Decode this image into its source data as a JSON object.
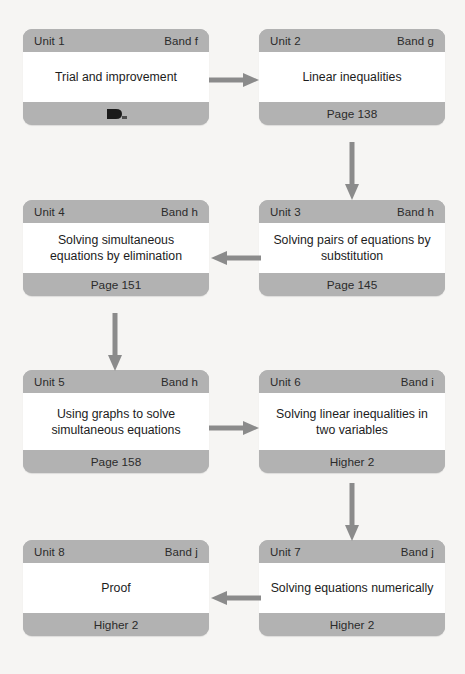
{
  "diagram": {
    "background_color": "#f6f5f3",
    "band_color": "#b2b2b2",
    "body_color": "#ffffff",
    "arrow_color": "#8b8b8b",
    "text_color": "#1c1c1c"
  },
  "units": [
    {
      "id": "unit-1",
      "unit": "Unit 1",
      "band": "Band f",
      "title": "Trial and improvement",
      "footer": "",
      "footer_icon": "smudge-icon",
      "footer_obscured": true
    },
    {
      "id": "unit-2",
      "unit": "Unit 2",
      "band": "Band g",
      "title": "Linear inequalities",
      "footer": "Page 138",
      "footer_obscured": false
    },
    {
      "id": "unit-3",
      "unit": "Unit 3",
      "band": "Band h",
      "title": "Solving pairs of equations by substitution",
      "footer": "Page 145",
      "footer_obscured": false
    },
    {
      "id": "unit-4",
      "unit": "Unit 4",
      "band": "Band h",
      "title": "Solving simultaneous equations by elimination",
      "footer": "Page 151",
      "footer_obscured": false
    },
    {
      "id": "unit-5",
      "unit": "Unit 5",
      "band": "Band h",
      "title": "Using graphs to solve simultaneous equations",
      "footer": "Page 158",
      "footer_obscured": false
    },
    {
      "id": "unit-6",
      "unit": "Unit 6",
      "band": "Band i",
      "title": "Solving linear inequalities in two variables",
      "footer": "Higher 2",
      "footer_obscured": false
    },
    {
      "id": "unit-7",
      "unit": "Unit 7",
      "band": "Band j",
      "title": "Solving equations numerically",
      "footer": "Higher 2",
      "footer_obscured": false
    },
    {
      "id": "unit-8",
      "unit": "Unit 8",
      "band": "Band j",
      "title": "Proof",
      "footer": "Higher 2",
      "footer_obscured": false
    }
  ],
  "connectors": [
    {
      "id": "arrow-1-to-2",
      "from": "unit-1",
      "to": "unit-2",
      "direction": "right"
    },
    {
      "id": "arrow-2-to-3",
      "from": "unit-2",
      "to": "unit-3",
      "direction": "down"
    },
    {
      "id": "arrow-3-to-4",
      "from": "unit-3",
      "to": "unit-4",
      "direction": "left"
    },
    {
      "id": "arrow-4-to-5",
      "from": "unit-4",
      "to": "unit-5",
      "direction": "down"
    },
    {
      "id": "arrow-5-to-6",
      "from": "unit-5",
      "to": "unit-6",
      "direction": "right"
    },
    {
      "id": "arrow-6-to-7",
      "from": "unit-6",
      "to": "unit-7",
      "direction": "down"
    },
    {
      "id": "arrow-7-to-8",
      "from": "unit-7",
      "to": "unit-8",
      "direction": "left"
    }
  ]
}
